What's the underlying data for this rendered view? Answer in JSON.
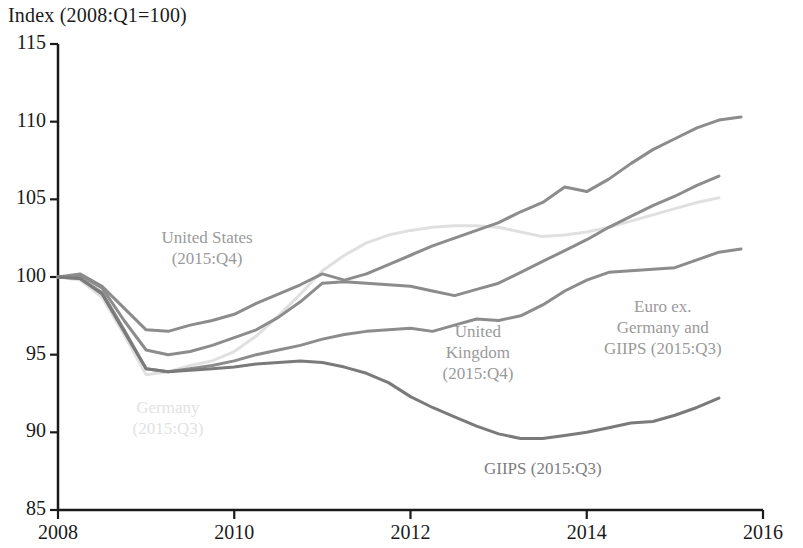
{
  "chart_data": {
    "type": "line",
    "title": "Index (2008:Q1=100)",
    "xlabel": "",
    "ylabel": "",
    "xlim": [
      2008,
      2016
    ],
    "ylim": [
      85,
      115
    ],
    "xticks": [
      2008,
      2010,
      2012,
      2014,
      2016
    ],
    "xtick_labels": [
      "2008",
      "2010",
      "2012",
      "2014",
      "2016"
    ],
    "yticks": [
      85,
      90,
      95,
      100,
      105,
      110,
      115
    ],
    "ytick_labels": [
      "85",
      "90",
      "95",
      "100",
      "105",
      "110",
      "115"
    ],
    "grid": false,
    "legend": "inline-annotations",
    "series": [
      {
        "name": "United States",
        "label": "United States\n(2015:Q4)",
        "color": "#8c8c8c",
        "end_period": "2015:Q4",
        "x": [
          2008.0,
          2008.25,
          2008.5,
          2008.75,
          2009.0,
          2009.25,
          2009.5,
          2009.75,
          2010.0,
          2010.25,
          2010.5,
          2010.75,
          2011.0,
          2011.25,
          2011.5,
          2011.75,
          2012.0,
          2012.25,
          2012.5,
          2012.75,
          2013.0,
          2013.25,
          2013.5,
          2013.75,
          2014.0,
          2014.25,
          2014.5,
          2014.75,
          2015.0,
          2015.25,
          2015.5,
          2015.75
        ],
        "values": [
          100.0,
          100.2,
          99.4,
          98.0,
          96.6,
          96.5,
          96.9,
          97.2,
          97.6,
          98.3,
          98.9,
          99.5,
          100.2,
          99.8,
          100.2,
          100.8,
          101.4,
          102.0,
          102.5,
          103.0,
          103.5,
          104.2,
          104.8,
          105.8,
          105.5,
          106.3,
          107.3,
          108.2,
          108.9,
          109.6,
          110.1,
          110.3
        ]
      },
      {
        "name": "Euro ex. Germany and GIIPS",
        "label": "Euro ex.\nGermany and\nGIIPS (2015:Q3)",
        "color": "#8c8c8c",
        "end_period": "2015:Q3",
        "x": [
          2008.0,
          2008.25,
          2008.5,
          2008.75,
          2009.0,
          2009.25,
          2009.5,
          2009.75,
          2010.0,
          2010.25,
          2010.5,
          2010.75,
          2011.0,
          2011.25,
          2011.5,
          2011.75,
          2012.0,
          2012.25,
          2012.5,
          2012.75,
          2013.0,
          2013.25,
          2013.5,
          2013.75,
          2014.0,
          2014.25,
          2014.5,
          2014.75,
          2015.0,
          2015.25,
          2015.5
        ],
        "values": [
          100.0,
          100.1,
          99.3,
          97.2,
          95.3,
          95.0,
          95.2,
          95.6,
          96.1,
          96.6,
          97.4,
          98.4,
          99.6,
          99.7,
          99.6,
          99.5,
          99.4,
          99.1,
          98.8,
          99.2,
          99.6,
          100.3,
          101.0,
          101.7,
          102.4,
          103.2,
          103.9,
          104.6,
          105.2,
          105.9,
          106.5
        ]
      },
      {
        "name": "Germany",
        "label": "Germany\n(2015:Q3)",
        "color": "#e0e0e0",
        "end_period": "2015:Q3",
        "x": [
          2008.0,
          2008.25,
          2008.5,
          2008.75,
          2009.0,
          2009.25,
          2009.5,
          2009.75,
          2010.0,
          2010.25,
          2010.5,
          2010.75,
          2011.0,
          2011.25,
          2011.5,
          2011.75,
          2012.0,
          2012.25,
          2012.5,
          2012.75,
          2013.0,
          2013.25,
          2013.5,
          2013.75,
          2014.0,
          2014.25,
          2014.5,
          2014.75,
          2015.0,
          2015.25,
          2015.5
        ],
        "values": [
          100.0,
          99.8,
          98.7,
          96.3,
          93.7,
          93.9,
          94.3,
          94.6,
          95.2,
          96.2,
          97.5,
          98.9,
          100.4,
          101.4,
          102.2,
          102.7,
          103.0,
          103.2,
          103.3,
          103.3,
          103.2,
          102.9,
          102.6,
          102.7,
          102.9,
          103.2,
          103.6,
          104.0,
          104.4,
          104.8,
          105.1
        ]
      },
      {
        "name": "United Kingdom",
        "label": "United\nKingdom\n(2015:Q4)",
        "color": "#8c8c8c",
        "end_period": "2015:Q4",
        "x": [
          2008.0,
          2008.25,
          2008.5,
          2008.75,
          2009.0,
          2009.25,
          2009.5,
          2009.75,
          2010.0,
          2010.25,
          2010.5,
          2010.75,
          2011.0,
          2011.25,
          2011.5,
          2011.75,
          2012.0,
          2012.25,
          2012.5,
          2012.75,
          2013.0,
          2013.25,
          2013.5,
          2013.75,
          2014.0,
          2014.25,
          2014.5,
          2014.75,
          2015.0,
          2015.25,
          2015.5,
          2015.75
        ],
        "values": [
          100.0,
          99.9,
          99.0,
          96.6,
          94.1,
          93.9,
          94.1,
          94.3,
          94.6,
          95.0,
          95.3,
          95.6,
          96.0,
          96.3,
          96.5,
          96.6,
          96.7,
          96.5,
          96.9,
          97.3,
          97.2,
          97.5,
          98.2,
          99.1,
          99.8,
          100.3,
          100.4,
          100.5,
          100.6,
          101.1,
          101.6,
          101.8
        ]
      },
      {
        "name": "GIIPS",
        "label": "GIIPS (2015:Q3)",
        "color": "#7a7a7a",
        "end_period": "2015:Q3",
        "x": [
          2008.0,
          2008.25,
          2008.5,
          2008.75,
          2009.0,
          2009.25,
          2009.5,
          2009.75,
          2010.0,
          2010.25,
          2010.5,
          2010.75,
          2011.0,
          2011.25,
          2011.5,
          2011.75,
          2012.0,
          2012.25,
          2012.5,
          2012.75,
          2013.0,
          2013.25,
          2013.5,
          2013.75,
          2014.0,
          2014.25,
          2014.5,
          2014.75,
          2015.0,
          2015.25,
          2015.5
        ],
        "values": [
          100.0,
          99.9,
          98.9,
          96.5,
          94.1,
          93.9,
          94.0,
          94.1,
          94.2,
          94.4,
          94.5,
          94.6,
          94.5,
          94.2,
          93.8,
          93.2,
          92.3,
          91.6,
          91.0,
          90.4,
          89.9,
          89.6,
          89.6,
          89.8,
          90.0,
          90.3,
          90.6,
          90.7,
          91.1,
          91.6,
          92.2
        ]
      }
    ],
    "annotations": [
      {
        "id": "united-states",
        "text": "United States\n(2015:Q4)",
        "x_px": 207,
        "y_px": 248,
        "color": "#9a9a9a"
      },
      {
        "id": "germany",
        "text": "Germany\n(2015:Q3)",
        "x_px": 168,
        "y_px": 418,
        "color": "#e2e2e2"
      },
      {
        "id": "united-kingdom",
        "text": "United\nKingdom\n(2015:Q4)",
        "x_px": 478,
        "y_px": 352,
        "color": "#9a9a9a"
      },
      {
        "id": "euro-ex-germany-giips",
        "text": "Euro ex.\nGermany and\nGIIPS (2015:Q3)",
        "x_px": 663,
        "y_px": 327,
        "color": "#9a9a9a"
      },
      {
        "id": "giips",
        "text": "GIIPS (2015:Q3)",
        "x_px": 543,
        "y_px": 468,
        "color": "#7e7e7e"
      }
    ],
    "axis_color": "#1a1a1a"
  }
}
